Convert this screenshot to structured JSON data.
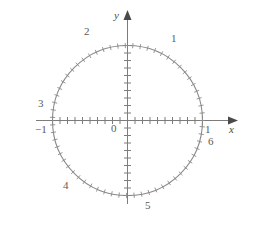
{
  "figure": {
    "background": "#ffffff",
    "stroke_color": "#8a8a8a",
    "axis_color": "#7c7c7c",
    "text_color": "#5a5a5a"
  },
  "axes": {
    "x_label": "x",
    "y_label": "y",
    "origin_label": "0",
    "x_tick_labels": [
      {
        "text": "−1",
        "value": -1
      },
      {
        "text": "1",
        "value": 1
      }
    ]
  },
  "chart_data": {
    "type": "scatter",
    "title": "",
    "xlabel": "x",
    "ylabel": "y",
    "xlim": [
      -1.45,
      1.45
    ],
    "ylim": [
      -1.3,
      1.3
    ],
    "grid": false,
    "legend": null,
    "circle": {
      "center": [
        0,
        0
      ],
      "radius": 1,
      "tick_count": 63,
      "tick_spacing_radians": 0.1,
      "description": "unit circle marked with ticks every 0.1 radian of arc length"
    },
    "annotations": [
      {
        "text": "1",
        "radian_position": 1.0,
        "x": 0.54,
        "y": 0.84
      },
      {
        "text": "2",
        "radian_position": 2.0,
        "x": -0.42,
        "y": 0.91
      },
      {
        "text": "3",
        "radian_position": 3.0,
        "x": -0.99,
        "y": 0.14
      },
      {
        "text": "4",
        "radian_position": 4.0,
        "x": -0.65,
        "y": -0.76
      },
      {
        "text": "5",
        "radian_position": 5.0,
        "x": 0.28,
        "y": -0.96
      },
      {
        "text": "6",
        "radian_position": 6.0,
        "x": 0.96,
        "y": -0.28
      },
      {
        "text": "−1",
        "radian_position": null,
        "x": -1.0,
        "y": 0
      },
      {
        "text": "1",
        "radian_position": null,
        "x": 1.0,
        "y": 0
      },
      {
        "text": "0",
        "radian_position": null,
        "x": 0,
        "y": 0
      }
    ],
    "axis_ticks": {
      "x_minor_interval": 0.1,
      "y_minor_interval": 0.1,
      "x_range": [
        -1.0,
        1.0
      ],
      "y_range": [
        -1.0,
        1.0
      ]
    }
  }
}
